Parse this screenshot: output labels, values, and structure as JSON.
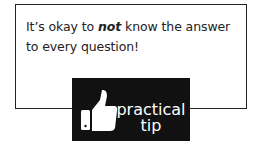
{
  "tip": {
    "text_before": "It’s okay to ",
    "text_emphasis": "not",
    "text_after": " know the answer to every question!"
  },
  "badge": {
    "icon": "thumbs-up-icon",
    "line1": "practical",
    "line2": "tip",
    "background": "#111111",
    "foreground": "#ffffff"
  }
}
